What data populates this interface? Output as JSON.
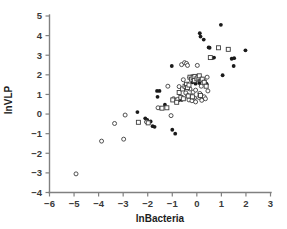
{
  "chart_data": {
    "type": "scatter",
    "title": "",
    "xlabel": "lnBacteria",
    "ylabel": "lnVLP",
    "xlim": [
      -6,
      3
    ],
    "ylim": [
      -4,
      5
    ],
    "xticks": [
      -6,
      -5,
      -4,
      -3,
      -2,
      -1,
      0,
      1,
      2,
      3
    ],
    "xtick_labels": [
      "−6",
      "−5",
      "−4",
      "−3",
      "−2",
      "−1",
      "0",
      "1",
      "2",
      "3"
    ],
    "yticks": [
      -4,
      -3,
      -2,
      -1,
      0,
      1,
      2,
      3,
      4,
      5
    ],
    "ytick_labels": [
      "−4",
      "−3",
      "−2",
      "−1",
      "0",
      "1",
      "2",
      "3",
      "4",
      "5"
    ],
    "grid": false,
    "legend": "none",
    "marker_colors": {
      "filled": "#1a1a1a",
      "open_stroke": "#3d3d3d",
      "open_fill": "#ffffff",
      "axis": "#808080",
      "text": "#1d1d1d"
    },
    "series": [
      {
        "name": "filled-diamond",
        "marker": "filled",
        "points": [
          [
            -2.42,
            0.1
          ],
          [
            -2.1,
            -0.22
          ],
          [
            -2.02,
            -0.3
          ],
          [
            -1.88,
            -0.38
          ],
          [
            -1.8,
            -0.62
          ],
          [
            -1.72,
            -0.65
          ],
          [
            -1.62,
            1.18
          ],
          [
            -1.6,
            0.88
          ],
          [
            -1.52,
            1.18
          ],
          [
            -1.46,
            0.3
          ],
          [
            -1.3,
            0.48
          ],
          [
            -1.02,
            2.45
          ],
          [
            -1.0,
            -0.8
          ],
          [
            -0.88,
            -1.0
          ],
          [
            -0.52,
            1.3
          ],
          [
            -0.4,
            1.0
          ],
          [
            -0.3,
            1.88
          ],
          [
            -0.22,
            1.92
          ],
          [
            -0.18,
            1.62
          ],
          [
            -0.12,
            1.95
          ],
          [
            -0.05,
            1.55
          ],
          [
            0.05,
            1.75
          ],
          [
            0.1,
            1.58
          ],
          [
            0.12,
            4.12
          ],
          [
            0.15,
            3.95
          ],
          [
            0.22,
            0.9
          ],
          [
            0.28,
            3.8
          ],
          [
            0.32,
            1.68
          ],
          [
            0.38,
            1.55
          ],
          [
            0.4,
            1.52
          ],
          [
            0.48,
            3.4
          ],
          [
            0.52,
            3.38
          ],
          [
            0.62,
            2.85
          ],
          [
            0.7,
            2.88
          ],
          [
            0.98,
            4.55
          ],
          [
            1.05,
            1.98
          ],
          [
            1.28,
            3.3
          ],
          [
            1.42,
            2.82
          ],
          [
            1.5,
            2.45
          ],
          [
            1.52,
            2.85
          ],
          [
            1.98,
            3.25
          ],
          [
            -0.62,
            0.72
          ],
          [
            -0.7,
            0.75
          ],
          [
            -0.75,
            0.7
          ],
          [
            0.18,
            1.82
          ]
        ]
      },
      {
        "name": "open-circle",
        "marker": "circle",
        "points": [
          [
            -4.92,
            -3.05
          ],
          [
            -3.88,
            -1.38
          ],
          [
            -3.35,
            -0.48
          ],
          [
            -2.98,
            -1.28
          ],
          [
            -2.92,
            -0.05
          ],
          [
            -2.05,
            -0.4
          ],
          [
            -1.58,
            0.32
          ],
          [
            -1.18,
            1.42
          ],
          [
            -1.05,
            -0.08
          ],
          [
            -0.95,
            0.78
          ],
          [
            -0.88,
            0.7
          ],
          [
            -0.78,
            0.75
          ],
          [
            -0.72,
            1.4
          ],
          [
            -0.62,
            2.52
          ],
          [
            -0.55,
            1.75
          ],
          [
            -0.5,
            2.62
          ],
          [
            -0.42,
            2.58
          ],
          [
            -0.38,
            2.48
          ],
          [
            -0.35,
            1.32
          ],
          [
            -0.32,
            0.72
          ],
          [
            -0.28,
            1.28
          ],
          [
            -0.25,
            0.92
          ],
          [
            -0.2,
            0.68
          ],
          [
            -0.15,
            1.12
          ],
          [
            -0.1,
            0.82
          ],
          [
            -0.05,
            1.22
          ],
          [
            0.02,
            2.48
          ],
          [
            0.08,
            0.85
          ],
          [
            0.12,
            1.05
          ],
          [
            0.18,
            1.42
          ],
          [
            0.25,
            1.7
          ],
          [
            0.3,
            0.88
          ],
          [
            0.35,
            0.78
          ],
          [
            0.42,
            1.88
          ],
          [
            0.45,
            1.18
          ],
          [
            -0.05,
            0.62
          ],
          [
            0.2,
            0.7
          ],
          [
            -0.45,
            1.08
          ]
        ]
      },
      {
        "name": "open-square",
        "marker": "square",
        "points": [
          [
            -2.38,
            -0.42
          ],
          [
            -1.98,
            -0.45
          ],
          [
            -1.42,
            0.3
          ],
          [
            -1.22,
            0.32
          ],
          [
            -0.98,
            0.72
          ],
          [
            -0.82,
            0.6
          ],
          [
            -0.72,
            1.1
          ],
          [
            -0.65,
            0.85
          ],
          [
            -0.58,
            1.28
          ],
          [
            -0.48,
            1.42
          ],
          [
            -0.42,
            1.52
          ],
          [
            -0.38,
            1.35
          ],
          [
            -0.32,
            1.48
          ],
          [
            -0.28,
            1.88
          ],
          [
            -0.22,
            1.78
          ],
          [
            -0.15,
            1.85
          ],
          [
            -0.1,
            1.72
          ],
          [
            -0.08,
            1.92
          ],
          [
            0.0,
            1.8
          ],
          [
            0.05,
            1.88
          ],
          [
            0.1,
            1.95
          ],
          [
            0.15,
            0.95
          ],
          [
            0.22,
            1.78
          ],
          [
            0.3,
            1.62
          ],
          [
            0.55,
            2.88
          ],
          [
            0.88,
            3.38
          ],
          [
            1.28,
            3.3
          ],
          [
            -0.55,
            0.78
          ],
          [
            -0.35,
            0.92
          ],
          [
            -0.18,
            0.88
          ],
          [
            0.38,
            1.42
          ]
        ]
      }
    ]
  },
  "axis_titles": {
    "x": "lnBacteria",
    "y": "lnVLP"
  }
}
